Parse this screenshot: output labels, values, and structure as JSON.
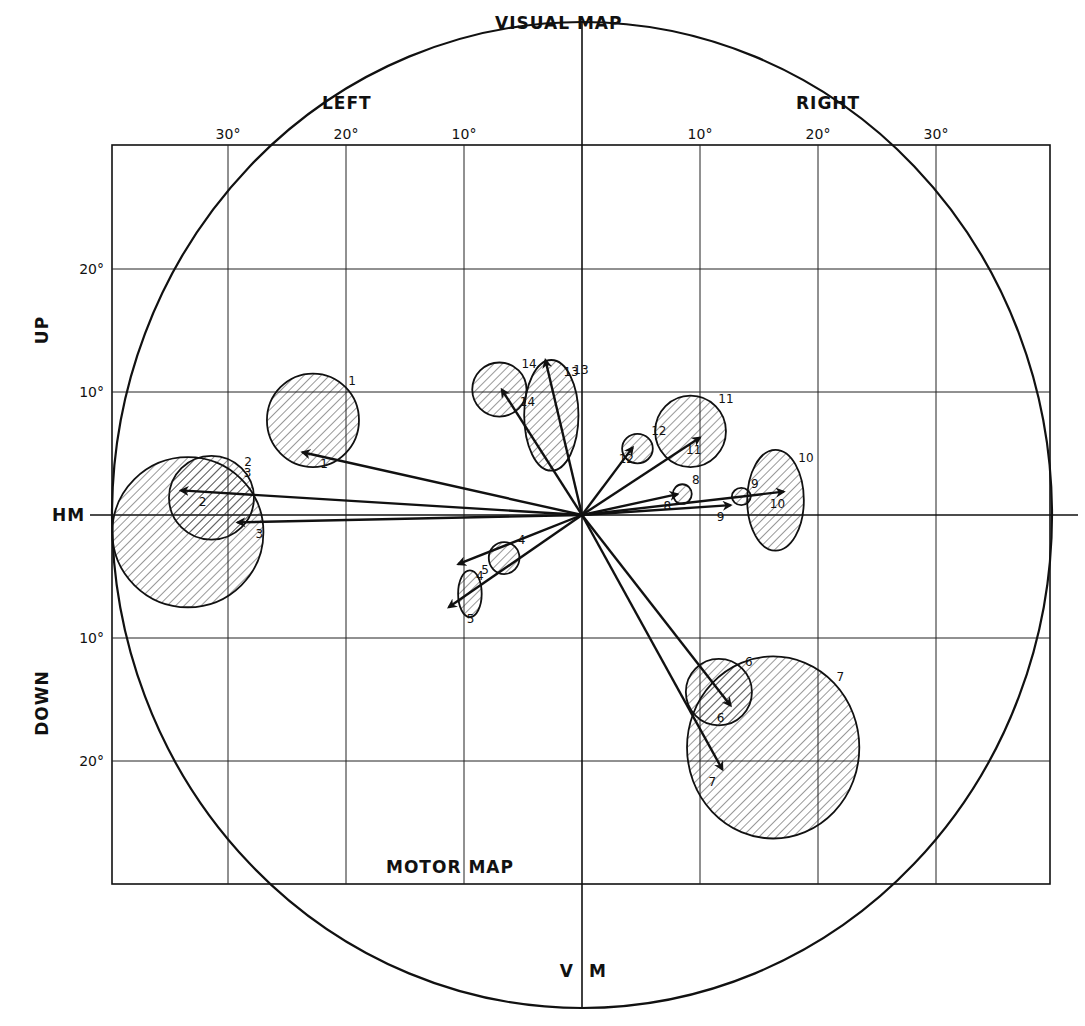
{
  "figure": {
    "title_top": "VISUAL  MAP",
    "title_bottom": "MOTOR  MAP",
    "left_label": "LEFT",
    "right_label": "RIGHT",
    "up_label": "UP",
    "down_label": "DOWN",
    "hm_label": "HM",
    "vm_left": "V",
    "vm_right": "M",
    "x_ticks": [
      {
        "value": -30,
        "label": "30°"
      },
      {
        "value": -20,
        "label": "20°"
      },
      {
        "value": -10,
        "label": "10°"
      },
      {
        "value": 10,
        "label": "10°"
      },
      {
        "value": 20,
        "label": "20°"
      },
      {
        "value": 30,
        "label": "30°"
      }
    ],
    "y_ticks": [
      {
        "value": 20,
        "label": "20°"
      },
      {
        "value": 10,
        "label": "10°"
      },
      {
        "value": -10,
        "label": "10°"
      },
      {
        "value": -20,
        "label": "20°"
      }
    ]
  },
  "chart_data": {
    "type": "scatter",
    "xlabel": "LEFT / RIGHT (deg)",
    "ylabel": "UP / DOWN (deg)",
    "xlim": [
      -40,
      40
    ],
    "ylim": [
      -30,
      30
    ],
    "grid": true,
    "sites": [
      {
        "id": "1",
        "field": {
          "cx": -22.8,
          "cy": 7.7,
          "rx": 3.9,
          "ry": 3.8
        },
        "vector": [
          -23.7,
          5.1
        ]
      },
      {
        "id": "2",
        "field": {
          "cx": -31.4,
          "cy": 1.4,
          "rx": 3.6,
          "ry": 3.4
        },
        "vector": [
          -34.0,
          2.0
        ]
      },
      {
        "id": "3",
        "field": {
          "cx": -33.4,
          "cy": -1.4,
          "rx": 6.4,
          "ry": 6.1
        },
        "vector": [
          -29.2,
          -0.6
        ]
      },
      {
        "id": "4",
        "field": {
          "cx": -6.6,
          "cy": -3.5,
          "rx": 1.3,
          "ry": 1.3
        },
        "vector": [
          -10.5,
          -4.0
        ]
      },
      {
        "id": "5",
        "field": {
          "cx": -9.5,
          "cy": -6.4,
          "rx": 1.0,
          "ry": 1.9
        },
        "vector": [
          -11.3,
          -7.5
        ]
      },
      {
        "id": "6",
        "field": {
          "cx": 11.6,
          "cy": -14.4,
          "rx": 2.8,
          "ry": 2.7
        },
        "vector": [
          12.6,
          -15.5
        ]
      },
      {
        "id": "7",
        "field": {
          "cx": 16.2,
          "cy": -18.9,
          "rx": 7.3,
          "ry": 7.4
        },
        "vector": [
          11.9,
          -20.7
        ]
      },
      {
        "id": "8",
        "field": {
          "cx": 8.5,
          "cy": 1.7,
          "rx": 0.8,
          "ry": 0.8
        },
        "vector": [
          8.1,
          1.7
        ]
      },
      {
        "id": "9",
        "field": {
          "cx": 13.5,
          "cy": 1.5,
          "rx": 0.8,
          "ry": 0.7
        },
        "vector": [
          12.6,
          0.8
        ]
      },
      {
        "id": "10",
        "field": {
          "cx": 16.4,
          "cy": 1.2,
          "rx": 2.4,
          "ry": 4.1
        },
        "vector": [
          17.1,
          1.9
        ]
      },
      {
        "id": "11",
        "field": {
          "cx": 9.2,
          "cy": 6.8,
          "rx": 3.0,
          "ry": 2.9
        },
        "vector": [
          10.0,
          6.3
        ]
      },
      {
        "id": "12",
        "field": {
          "cx": 4.7,
          "cy": 5.4,
          "rx": 1.3,
          "ry": 1.2
        },
        "vector": [
          4.3,
          5.5
        ]
      },
      {
        "id": "13",
        "field": {
          "cx": -2.6,
          "cy": 8.1,
          "rx": 2.3,
          "ry": 4.5
        },
        "vector": [
          -3.1,
          12.6
        ]
      },
      {
        "id": "14",
        "field": {
          "cx": -7.0,
          "cy": 10.2,
          "rx": 2.3,
          "ry": 2.2
        },
        "vector": [
          -6.8,
          10.2
        ]
      }
    ]
  }
}
